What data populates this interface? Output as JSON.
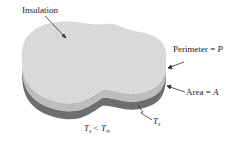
{
  "diagram": {
    "labels": {
      "insulation": "Insulation",
      "perimeter_prefix": "Perimeter = ",
      "perimeter_var": "P",
      "area_prefix": "Area = ",
      "area_var": "A",
      "surface_temp": "T",
      "surface_temp_sub": "s",
      "condition_T": "T",
      "condition_sub": "s",
      "condition_op": " < ",
      "condition_T2": "T",
      "condition_sub2": "∞"
    },
    "colors": {
      "insulation_top": "#d9d9d9",
      "side_light": "#bdbdbd",
      "base_dark": "#6e6e6e",
      "text": "#222222"
    }
  }
}
